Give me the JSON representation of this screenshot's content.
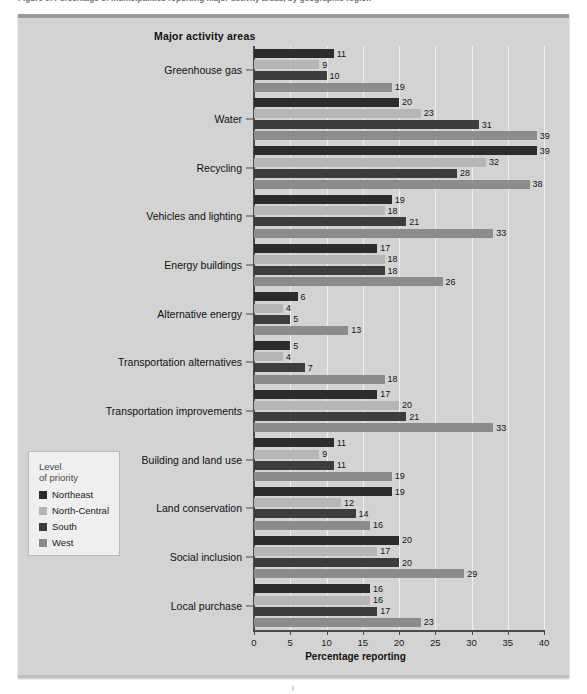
{
  "caption": "Figure 9. Percentage of municipalities reporting major activity areas, by geographic region",
  "panel": {
    "activity_axis_title": "Major activity areas",
    "x_axis_title": "Percentage reporting"
  },
  "legend": {
    "title_line1": "Level",
    "title_line2": "of priority",
    "items": [
      {
        "label": "Northeast",
        "color": "#2c2c2c"
      },
      {
        "label": "North-Central",
        "color": "#b6b6b6"
      },
      {
        "label": "South",
        "color": "#3d3d3d"
      },
      {
        "label": "West",
        "color": "#8c8c8c"
      }
    ]
  },
  "chart_data": {
    "type": "bar",
    "orientation": "horizontal",
    "title": "Major activity areas",
    "xlabel": "Percentage reporting",
    "ylabel": "Major activity areas",
    "xlim": [
      0,
      40
    ],
    "xticks": [
      0,
      5,
      10,
      15,
      20,
      25,
      30,
      35,
      40
    ],
    "grid": true,
    "legend_position": "left-inset",
    "categories": [
      "Greenhouse gas",
      "Water",
      "Recycling",
      "Vehicles and lighting",
      "Energy buildings",
      "Alternative energy",
      "Transportation alternatives",
      "Transportation improvements",
      "Building and land use",
      "Land conservation",
      "Social inclusion",
      "Local purchase"
    ],
    "series": [
      {
        "name": "Northeast",
        "color": "#2c2c2c",
        "values": [
          11,
          20,
          39,
          19,
          17,
          6,
          5,
          17,
          11,
          19,
          20,
          16
        ]
      },
      {
        "name": "North-Central",
        "color": "#b6b6b6",
        "values": [
          9,
          23,
          32,
          18,
          18,
          4,
          4,
          20,
          9,
          12,
          17,
          16
        ]
      },
      {
        "name": "South",
        "color": "#3d3d3d",
        "values": [
          10,
          31,
          28,
          21,
          18,
          5,
          7,
          21,
          11,
          14,
          20,
          17
        ]
      },
      {
        "name": "West",
        "color": "#8c8c8c",
        "values": [
          19,
          39,
          38,
          33,
          26,
          13,
          18,
          33,
          19,
          16,
          29,
          23
        ]
      }
    ]
  }
}
